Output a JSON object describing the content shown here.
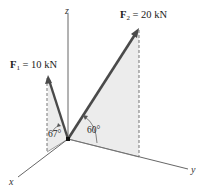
{
  "diagram": {
    "forces": [
      {
        "name": "F",
        "subscript": "1",
        "eq": " = 10 kN",
        "magnitude": "10 kN",
        "angle_label": "67°"
      },
      {
        "name": "F",
        "subscript": "2",
        "eq": " = 20 kN",
        "magnitude": "20 kN",
        "angle_label": "60°"
      }
    ],
    "axes": {
      "x": "x",
      "y": "y",
      "z": "z"
    },
    "colors": {
      "force_arrow": "#4a4a4a",
      "axis": "#555555",
      "plane_fill": "#ececec",
      "dashed": "#666666"
    }
  }
}
